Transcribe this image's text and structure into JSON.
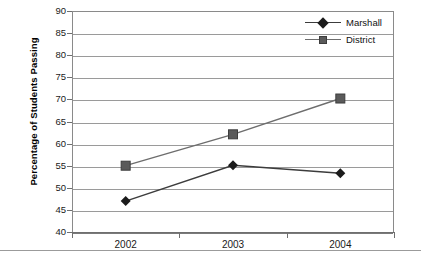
{
  "chart_data": {
    "type": "line",
    "title": "",
    "xlabel": "",
    "ylabel": "Percentage of Students Passing",
    "categories": [
      "2002",
      "2003",
      "2004"
    ],
    "ylim": [
      40,
      90
    ],
    "yticks": [
      40,
      45,
      50,
      55,
      60,
      65,
      70,
      75,
      80,
      85,
      90
    ],
    "ytick_labels": [
      "40",
      "45",
      "50",
      "55",
      "60",
      "65",
      "70",
      "75",
      "80",
      "85",
      "90"
    ],
    "grid": "horizontal",
    "legend_position": "top-right",
    "series": [
      {
        "name": "Marshall",
        "marker": "diamond",
        "color": "#1b1b1b",
        "values": [
          47.0,
          55.1,
          53.3
        ]
      },
      {
        "name": "District",
        "marker": "square",
        "color": "#5a5a5a",
        "values": [
          55.0,
          62.1,
          70.2
        ]
      }
    ]
  },
  "legend": {
    "items": [
      {
        "label": "Marshall",
        "marker": "diamond-marker"
      },
      {
        "label": "District",
        "marker": "square-marker"
      }
    ]
  },
  "axes": {
    "y_title": "Percentage of Students Passing"
  }
}
